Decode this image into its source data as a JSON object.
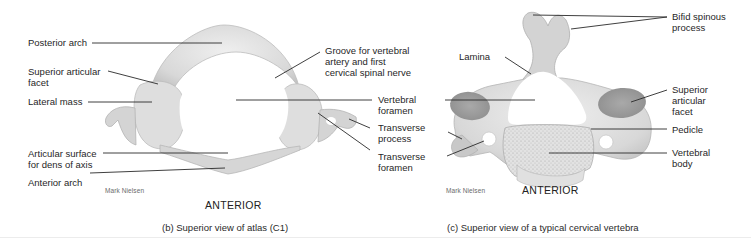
{
  "figure_b": {
    "caption": "(b) Superior view of atlas (C1)",
    "orientation": "ANTERIOR",
    "credit": "Mark Nielsen",
    "labels": [
      {
        "id": "posterior-arch",
        "text": "Posterior arch"
      },
      {
        "id": "superior-articular-facet",
        "text": "Superior articular\nfacet"
      },
      {
        "id": "lateral-mass",
        "text": "Lateral mass"
      },
      {
        "id": "articular-surface-dens",
        "text": "Articular surface\nfor dens of axis"
      },
      {
        "id": "anterior-arch",
        "text": "Anterior arch"
      },
      {
        "id": "groove-vertebral-artery",
        "text": "Groove for vertebral\nartery and first\ncervical spinal nerve"
      },
      {
        "id": "vertebral-foramen",
        "text": "Vertebral\nforamen"
      },
      {
        "id": "transverse-process",
        "text": "Transverse\nprocess"
      },
      {
        "id": "transverse-foramen",
        "text": "Transverse\nforamen"
      }
    ]
  },
  "figure_c": {
    "caption": "(c) Superior view of a typical cervical vertebra",
    "orientation": "ANTERIOR",
    "credit": "Mark Nielsen",
    "labels": [
      {
        "id": "bifid-spinous-process",
        "text": "Bifid spinous\nprocess"
      },
      {
        "id": "lamina",
        "text": "Lamina"
      },
      {
        "id": "superior-articular-facet",
        "text": "Superior\narticular\nfacet"
      },
      {
        "id": "pedicle",
        "text": "Pedicle"
      },
      {
        "id": "vertebral-body",
        "text": "Vertebral\nbody"
      }
    ]
  },
  "colors": {
    "bone_light": "#e6e6e6",
    "bone_mid": "#cfcfcf",
    "bone_dark": "#b4b4b4",
    "leader_line": "#2a2a2a"
  }
}
